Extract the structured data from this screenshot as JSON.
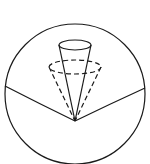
{
  "diagram": {
    "colors": {
      "stroke": "#1a1a1a",
      "background": "#ffffff"
    },
    "sphere": {
      "cx": 75,
      "cy": 94,
      "r": 70
    },
    "surface_curve": {
      "path": "M5,86 Q40,104 75,121 Q110,104 145,88"
    },
    "solid_cone": {
      "apex": [
        75,
        121
      ],
      "top_ellipse": {
        "cx": 75,
        "cy": 45,
        "rx": 16,
        "ry": 5
      }
    },
    "dashed_cone": {
      "apex": [
        75,
        121
      ],
      "top_ellipse": {
        "cx": 75,
        "cy": 67,
        "rx": 26,
        "ry": 7
      }
    }
  }
}
